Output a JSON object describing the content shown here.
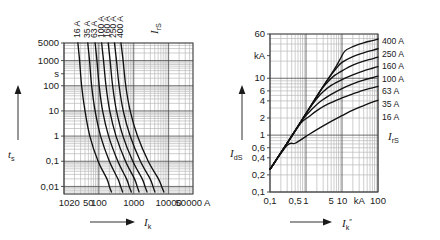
{
  "figure": {
    "background": "#ffffff",
    "curve_color": "#111111",
    "grid_major_color": "#4a4a4a",
    "grid_minor_color": "#b9b9b9"
  },
  "chart_data": [
    {
      "id": "left",
      "type": "line",
      "title": "",
      "xlabel": "I_k",
      "ylabel": "t_s",
      "xlabel_main": "I",
      "xlabel_sub": "k",
      "ylabel_main": "t",
      "ylabel_sub": "s",
      "xscale": "log",
      "yscale": "log",
      "xlim": [
        10,
        50000
      ],
      "ylim": [
        0.005,
        5000
      ],
      "grid": true,
      "legend_position": "top",
      "legend_title_main": "I",
      "legend_title_sub": "rS",
      "xticks": [
        {
          "value": 10,
          "label": "10"
        },
        {
          "value": 20,
          "label": "20"
        },
        {
          "value": 50,
          "label": "50"
        },
        {
          "value": 100,
          "label": "100"
        },
        {
          "value": 1000,
          "label": "1000"
        },
        {
          "value": 10000,
          "label": "10000"
        },
        {
          "value": 50000,
          "label": "50000 A"
        }
      ],
      "yticks": [
        {
          "value": 5000,
          "label": "5000"
        },
        {
          "value": 1000,
          "label": "1000"
        },
        {
          "value": 300,
          "label": "s"
        },
        {
          "value": 100,
          "label": "100"
        },
        {
          "value": 10,
          "label": "10"
        },
        {
          "value": 1,
          "label": "1"
        },
        {
          "value": 0.1,
          "label": "0,1"
        },
        {
          "value": 0.01,
          "label": "0,01"
        }
      ],
      "series": [
        {
          "name": "16 A",
          "label": "16 A",
          "points": [
            [
              25,
              5000
            ],
            [
              28,
              1000
            ],
            [
              32,
              100
            ],
            [
              40,
              10
            ],
            [
              55,
              1
            ],
            [
              95,
              0.1
            ],
            [
              170,
              0.02
            ],
            [
              200,
              0.01
            ],
            [
              230,
              0.006
            ]
          ]
        },
        {
          "name": "35 A",
          "label": "35 A",
          "points": [
            [
              48,
              5000
            ],
            [
              54,
              1000
            ],
            [
              62,
              100
            ],
            [
              78,
              10
            ],
            [
              112,
              1
            ],
            [
              200,
              0.1
            ],
            [
              350,
              0.02
            ],
            [
              420,
              0.01
            ],
            [
              480,
              0.006
            ]
          ]
        },
        {
          "name": "63 A",
          "label": "63 A",
          "points": [
            [
              78,
              5000
            ],
            [
              88,
              1000
            ],
            [
              102,
              100
            ],
            [
              128,
              10
            ],
            [
              190,
              1
            ],
            [
              350,
              0.1
            ],
            [
              620,
              0.02
            ],
            [
              740,
              0.01
            ],
            [
              850,
              0.006
            ]
          ]
        },
        {
          "name": "100 A",
          "label": "100 A",
          "points": [
            [
              120,
              5000
            ],
            [
              136,
              1000
            ],
            [
              160,
              100
            ],
            [
              205,
              10
            ],
            [
              310,
              1
            ],
            [
              580,
              0.1
            ],
            [
              1050,
              0.02
            ],
            [
              1250,
              0.01
            ],
            [
              1420,
              0.006
            ]
          ]
        },
        {
          "name": "160 A",
          "label": "160 A",
          "points": [
            [
              185,
              5000
            ],
            [
              210,
              1000
            ],
            [
              248,
              100
            ],
            [
              320,
              10
            ],
            [
              490,
              1
            ],
            [
              940,
              0.1
            ],
            [
              1750,
              0.02
            ],
            [
              2100,
              0.01
            ],
            [
              2400,
              0.006
            ]
          ]
        },
        {
          "name": "250 A",
          "label": "250 A",
          "points": [
            [
              280,
              5000
            ],
            [
              320,
              1000
            ],
            [
              380,
              100
            ],
            [
              500,
              10
            ],
            [
              790,
              1
            ],
            [
              1550,
              0.1
            ],
            [
              2950,
              0.02
            ],
            [
              3550,
              0.01
            ],
            [
              4050,
              0.006
            ]
          ]
        },
        {
          "name": "400 A",
          "label": "400 A",
          "points": [
            [
              430,
              5000
            ],
            [
              495,
              1000
            ],
            [
              590,
              100
            ],
            [
              790,
              10
            ],
            [
              1280,
              1
            ],
            [
              2600,
              0.1
            ],
            [
              5100,
              0.02
            ],
            [
              6300,
              0.01
            ],
            [
              7300,
              0.006
            ]
          ]
        }
      ]
    },
    {
      "id": "right",
      "type": "line",
      "title": "",
      "xlabel": "I_k\"",
      "ylabel": "I_dS",
      "xlabel_main": "I",
      "xlabel_sub": "k",
      "xlabel_sup": "″",
      "ylabel_main": "I",
      "ylabel_sub": "dS",
      "xscale": "log",
      "yscale": "log",
      "xlim": [
        0.1,
        100
      ],
      "ylim": [
        0.1,
        60
      ],
      "xunit": "kA",
      "yunit": "kA",
      "grid": true,
      "legend_position": "right",
      "legend_title_main": "I",
      "legend_title_sub": "rS",
      "xticks": [
        {
          "value": 0.1,
          "label": "0,1"
        },
        {
          "value": 0.5,
          "label": "0,5"
        },
        {
          "value": 1,
          "label": "1"
        },
        {
          "value": 5,
          "label": "5"
        },
        {
          "value": 10,
          "label": "10"
        },
        {
          "value": 30,
          "label": "kA"
        },
        {
          "value": 100,
          "label": "100"
        }
      ],
      "yticks": [
        {
          "value": 60,
          "label": "60"
        },
        {
          "value": 25,
          "label": "kA"
        },
        {
          "value": 10,
          "label": "10"
        },
        {
          "value": 6,
          "label": "6"
        },
        {
          "value": 4,
          "label": "4"
        },
        {
          "value": 2,
          "label": "2"
        },
        {
          "value": 1,
          "label": "1"
        },
        {
          "value": 0.6,
          "label": "0,6"
        },
        {
          "value": 0.4,
          "label": "0,4"
        },
        {
          "value": 0.2,
          "label": "0,2"
        },
        {
          "value": 0.1,
          "label": "0,1"
        }
      ],
      "series": [
        {
          "name": "400 A",
          "label": "400 A",
          "points": [
            [
              0.1,
              0.25
            ],
            [
              0.3,
              0.72
            ],
            [
              1,
              2.4
            ],
            [
              3,
              7.2
            ],
            [
              6,
              14
            ],
            [
              9,
              22
            ],
            [
              12,
              30
            ],
            [
              20,
              36
            ],
            [
              40,
              42
            ],
            [
              70,
              46
            ],
            [
              100,
              49
            ]
          ]
        },
        {
          "name": "250 A",
          "label": "250 A",
          "points": [
            [
              0.1,
              0.25
            ],
            [
              0.3,
              0.72
            ],
            [
              1,
              2.4
            ],
            [
              3,
              7.2
            ],
            [
              5,
              11.5
            ],
            [
              7,
              15
            ],
            [
              10,
              19
            ],
            [
              20,
              24
            ],
            [
              40,
              28
            ],
            [
              70,
              31
            ],
            [
              100,
              33
            ]
          ]
        },
        {
          "name": "160 A",
          "label": "160 A",
          "points": [
            [
              0.1,
              0.25
            ],
            [
              0.3,
              0.72
            ],
            [
              1,
              2.4
            ],
            [
              2.5,
              6
            ],
            [
              4,
              8.6
            ],
            [
              6,
              11
            ],
            [
              10,
              13.5
            ],
            [
              20,
              17
            ],
            [
              40,
              20
            ],
            [
              70,
              22
            ],
            [
              100,
              23.5
            ]
          ]
        },
        {
          "name": "100 A",
          "label": "100 A",
          "points": [
            [
              0.1,
              0.25
            ],
            [
              0.3,
              0.72
            ],
            [
              1,
              2.4
            ],
            [
              2,
              4.4
            ],
            [
              3,
              5.8
            ],
            [
              5,
              7.5
            ],
            [
              10,
              9.5
            ],
            [
              20,
              11.5
            ],
            [
              40,
              13.5
            ],
            [
              70,
              15
            ],
            [
              100,
              16
            ]
          ]
        },
        {
          "name": "63 A",
          "label": "63 A",
          "points": [
            [
              0.1,
              0.25
            ],
            [
              0.3,
              0.72
            ],
            [
              0.8,
              1.85
            ],
            [
              1.5,
              2.9
            ],
            [
              2.5,
              3.9
            ],
            [
              5,
              5.2
            ],
            [
              10,
              6.6
            ],
            [
              20,
              8
            ],
            [
              40,
              9.3
            ],
            [
              70,
              10.2
            ],
            [
              100,
              10.9
            ]
          ]
        },
        {
          "name": "35 A",
          "label": "35 A",
          "points": [
            [
              0.1,
              0.25
            ],
            [
              0.3,
              0.72
            ],
            [
              0.7,
              1.6
            ],
            [
              1.2,
              2.1
            ],
            [
              2,
              2.7
            ],
            [
              4,
              3.5
            ],
            [
              10,
              4.5
            ],
            [
              20,
              5.3
            ],
            [
              40,
              6.2
            ],
            [
              70,
              6.8
            ],
            [
              100,
              7.2
            ]
          ]
        },
        {
          "name": "16 A",
          "label": "16 A",
          "points": [
            [
              0.1,
              0.25
            ],
            [
              0.3,
              0.66
            ],
            [
              0.5,
              0.72
            ],
            [
              1,
              0.95
            ],
            [
              2,
              1.25
            ],
            [
              5,
              1.75
            ],
            [
              10,
              2.2
            ],
            [
              20,
              2.75
            ],
            [
              40,
              3.3
            ],
            [
              70,
              3.8
            ],
            [
              100,
              4.1
            ]
          ]
        }
      ]
    }
  ]
}
